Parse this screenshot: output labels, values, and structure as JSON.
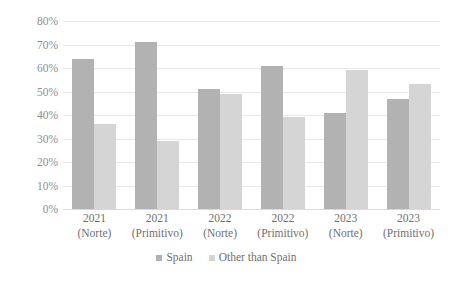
{
  "chart_data": {
    "type": "bar",
    "title": "",
    "subtitle": "",
    "xlabel": "",
    "ylabel": "",
    "ylim": [
      0,
      80
    ],
    "y_tick_labels": [
      "80%",
      "70%",
      "60%",
      "50%",
      "40%",
      "30%",
      "20%",
      "10%",
      "0%"
    ],
    "y_tick_values": [
      80,
      70,
      60,
      50,
      40,
      30,
      20,
      10,
      0
    ],
    "grid": true,
    "legend_position": "bottom",
    "categories": [
      "2021 (Norte)",
      "2021 (Primitivo)",
      "2022 (Norte)",
      "2022 (Primitivo)",
      "2023 (Norte)",
      "2023 (Primitivo)"
    ],
    "category_lines": [
      {
        "line1": "2021",
        "line2": "(Norte)"
      },
      {
        "line1": "2021",
        "line2": "(Primitivo)"
      },
      {
        "line1": "2022",
        "line2": "(Norte)"
      },
      {
        "line1": "2022",
        "line2": "(Primitivo)"
      },
      {
        "line1": "2023",
        "line2": "(Norte)"
      },
      {
        "line1": "2023",
        "line2": "(Primitivo)"
      }
    ],
    "series": [
      {
        "name": "Spain",
        "color": "#b2b2b2",
        "values": [
          64,
          71,
          51,
          61,
          41,
          47
        ]
      },
      {
        "name": "Other than Spain",
        "color": "#d5d5d5",
        "values": [
          36,
          29,
          49,
          39,
          59,
          53
        ]
      }
    ]
  },
  "legend": {
    "items": [
      {
        "label": "Spain",
        "swatch": "legend-swatch-spain"
      },
      {
        "label": "Other than Spain",
        "swatch": "legend-swatch-other"
      }
    ]
  },
  "colors": {
    "spain": "#b2b2b2",
    "other_than_spain": "#d5d5d5",
    "gridline": "#e8e8e8",
    "tick_text": "#8d8d8d",
    "category_text": "#6f6f6f",
    "background": "#ffffff"
  }
}
